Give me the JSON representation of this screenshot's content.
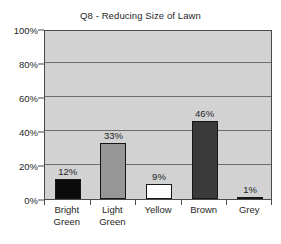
{
  "chart_data": {
    "type": "bar",
    "title": "Q8 - Reducing Size of Lawn",
    "xlabel": "",
    "ylabel": "",
    "categories": [
      "Bright Green",
      "Light Green",
      "Yellow",
      "Brown",
      "Grey"
    ],
    "values": [
      12,
      33,
      9,
      46,
      1
    ],
    "data_labels": [
      "12%",
      "33%",
      "9%",
      "46%",
      "1%"
    ],
    "ylim": [
      0,
      100
    ],
    "ytick_values": [
      0,
      20,
      40,
      60,
      80,
      100
    ],
    "ytick_labels": [
      "0%",
      "20%",
      "40%",
      "60%",
      "80%",
      "100%"
    ],
    "grid": true,
    "gridlines_at": [
      20,
      40,
      60,
      80,
      100
    ],
    "legend": false,
    "legend_position": "none",
    "bar_colors": [
      "#0b0b0b",
      "#969696",
      "#fdfdfd",
      "#3a3a3a",
      "#8f8f8f"
    ],
    "bar_edge_color": "#161616",
    "plot_background": "#d2d2d2",
    "figure_background": "#ffffff",
    "axis_color": "#4a4a4a",
    "gridline_color": "#6e6e6e",
    "category_lines": [
      [
        "Bright",
        "Green"
      ],
      [
        "Light",
        "Green"
      ],
      [
        "Yellow"
      ],
      [
        "Brown"
      ],
      [
        "Grey"
      ]
    ]
  }
}
